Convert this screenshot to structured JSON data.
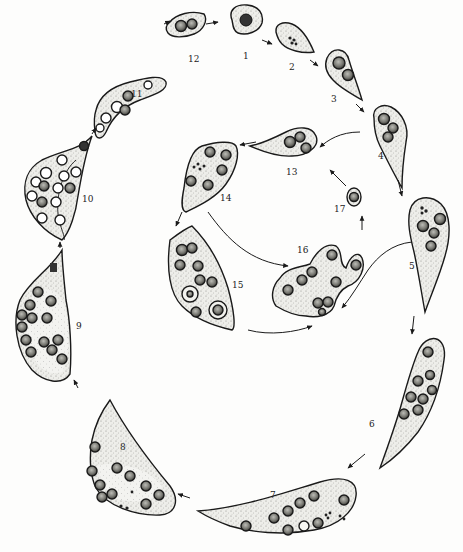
{
  "diagram": {
    "type": "life-cycle illustration",
    "style": "stippled pen drawing",
    "colors": {
      "outline": "#1a1a1a",
      "fill": "#e4e4e0",
      "nucleus": "#555555",
      "vacuole": "#ffffff"
    },
    "stages": [
      {
        "id": "1",
        "label": "1",
        "lx": 243,
        "ly": 52
      },
      {
        "id": "2",
        "label": "2",
        "lx": 289,
        "ly": 63
      },
      {
        "id": "3",
        "label": "3",
        "lx": 331,
        "ly": 95
      },
      {
        "id": "4",
        "label": "4",
        "lx": 378,
        "ly": 152
      },
      {
        "id": "5",
        "label": "5",
        "lx": 409,
        "ly": 262
      },
      {
        "id": "6",
        "label": "6",
        "lx": 369,
        "ly": 420
      },
      {
        "id": "7",
        "label": "7",
        "lx": 270,
        "ly": 491
      },
      {
        "id": "8",
        "label": "8",
        "lx": 120,
        "ly": 443
      },
      {
        "id": "9",
        "label": "9",
        "lx": 76,
        "ly": 322
      },
      {
        "id": "10",
        "label": "10",
        "lx": 82,
        "ly": 195
      },
      {
        "id": "11",
        "label": "11",
        "lx": 131,
        "ly": 90
      },
      {
        "id": "12",
        "label": "12",
        "lx": 188,
        "ly": 55
      },
      {
        "id": "13",
        "label": "13",
        "lx": 286,
        "ly": 168
      },
      {
        "id": "14",
        "label": "14",
        "lx": 220,
        "ly": 194
      },
      {
        "id": "15",
        "label": "15",
        "lx": 232,
        "ly": 281
      },
      {
        "id": "16",
        "label": "16",
        "lx": 297,
        "ly": 246
      },
      {
        "id": "17",
        "label": "17",
        "lx": 334,
        "ly": 205
      }
    ]
  }
}
